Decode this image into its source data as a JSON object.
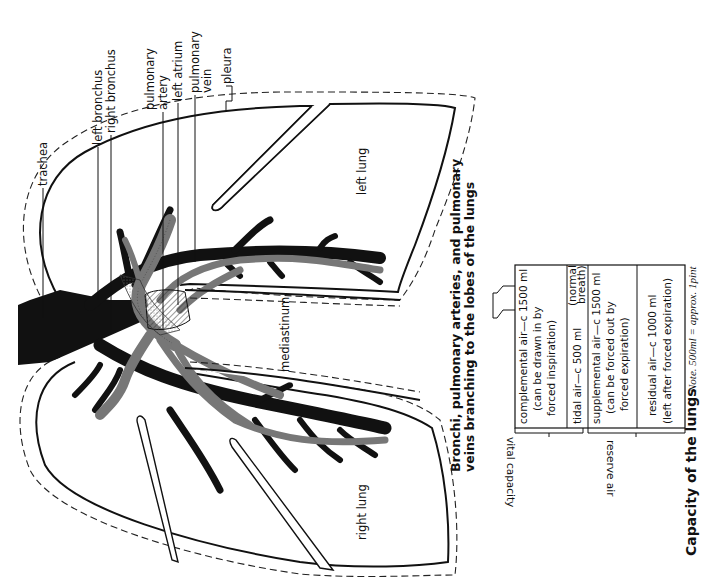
{
  "diagram_1": {
    "caption": "Bronchi, pulmonary arteries, and pulmonary veins branching to the lobes of the lungs",
    "caption_lines": [
      "Bronchi, pulmonary arteries, and pulmonary",
      "veins branching to the lobes of the lungs"
    ],
    "labels": {
      "trachea": "trachea",
      "left_bronchus": "left bronchus",
      "right_bronchus": "right bronchus",
      "pulmonary_artery_1": "pulmonary",
      "pulmonary_artery_2": "artery",
      "left_atrium": "left atrium",
      "pulmonary_vein_1": "pulmonary",
      "pulmonary_vein_2": "vein",
      "pleura": "pleura",
      "left_lung": "left lung",
      "right_lung": "right lung",
      "mediastinum": "mediastinum"
    }
  },
  "diagram_2": {
    "title": "Capacity of the lungs",
    "note": "Note. 500ml = approx. 1pint",
    "rows": [
      {
        "line1": "complemental air—c 1500 ml",
        "line2": "(can be drawn in by",
        "line3": "forced inspiration)"
      },
      {
        "line1": "tidal air—c 500 ml",
        "aside1": "(normal",
        "aside2": "breath)"
      },
      {
        "line1": "supplemental air—c 1500 ml",
        "line2": "(can be forced out by",
        "line3": "forced expiration)"
      },
      {
        "line1": "residual air—c 1000 ml",
        "line2": "(left after forced expiration)"
      }
    ],
    "groups": {
      "vital_capacity": "vital capacity",
      "reserve_air": "reserve air"
    }
  }
}
